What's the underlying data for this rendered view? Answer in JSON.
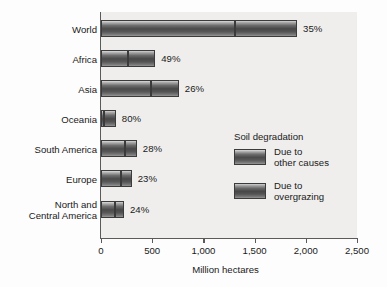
{
  "chart_data": {
    "type": "bar",
    "orientation": "horizontal",
    "stacked": true,
    "title": "",
    "xlabel": "Million hectares",
    "ylabel": "",
    "xlim": [
      0,
      2500
    ],
    "xticks": [
      0,
      500,
      1000,
      1500,
      2000,
      2500
    ],
    "xticklabels": [
      "0",
      "500",
      "1,000",
      "1,500",
      "2,000",
      "2,500"
    ],
    "grid": false,
    "legend": {
      "title": "Soil degradation",
      "position": "inside-right",
      "entries": [
        {
          "name": "Due to\nother causes",
          "color": "#4a4a4a"
        },
        {
          "name": "Due to\novergrazing",
          "color": "#474747"
        }
      ]
    },
    "categories": [
      "World",
      "Africa",
      "Asia",
      "Oceania",
      "South America",
      "Europe",
      "North and\nCentral America"
    ],
    "series": [
      {
        "name": "Due to other causes",
        "values": [
          1310,
          265,
          490,
          30,
          235,
          195,
          140
        ]
      },
      {
        "name": "Due to overgrazing",
        "values": [
          605,
          265,
          270,
          115,
          115,
          105,
          85
        ]
      }
    ],
    "totals": [
      1915,
      530,
      760,
      145,
      350,
      300,
      225
    ],
    "annotations": [
      "35%",
      "49%",
      "26%",
      "80%",
      "28%",
      "23%",
      "24%"
    ],
    "annotation_meaning": "share of total degradation due to overgrazing"
  },
  "axis": {
    "x_title": "Million hectares",
    "ticks": [
      {
        "value": 0,
        "label": "0"
      },
      {
        "value": 500,
        "label": "500"
      },
      {
        "value": 1000,
        "label": "1,000"
      },
      {
        "value": 1500,
        "label": "1,500"
      },
      {
        "value": 2000,
        "label": "2,000"
      },
      {
        "value": 2500,
        "label": "2,500"
      }
    ]
  },
  "bars": [
    {
      "label": "World",
      "other": 1310,
      "overgrazing": 605,
      "pct": "35%"
    },
    {
      "label": "Africa",
      "other": 265,
      "overgrazing": 265,
      "pct": "49%"
    },
    {
      "label": "Asia",
      "other": 490,
      "overgrazing": 270,
      "pct": "26%"
    },
    {
      "label": "Oceania",
      "other": 30,
      "overgrazing": 115,
      "pct": "80%"
    },
    {
      "label": "South America",
      "other": 235,
      "overgrazing": 115,
      "pct": "28%"
    },
    {
      "label": "Europe",
      "other": 195,
      "overgrazing": 105,
      "pct": "23%"
    },
    {
      "label": "North and\nCentral America",
      "other": 140,
      "overgrazing": 85,
      "pct": "24%"
    }
  ],
  "legend": {
    "title": "Soil degradation",
    "items": [
      {
        "label": "Due to\nother causes"
      },
      {
        "label": "Due to\novergrazing"
      }
    ]
  },
  "colors": {
    "plot_background": "#efeeec",
    "axis": "#5a5a5a",
    "bar_other": "#4a4a4a",
    "bar_overgrazing": "#474747",
    "text": "#1a1a1a"
  }
}
